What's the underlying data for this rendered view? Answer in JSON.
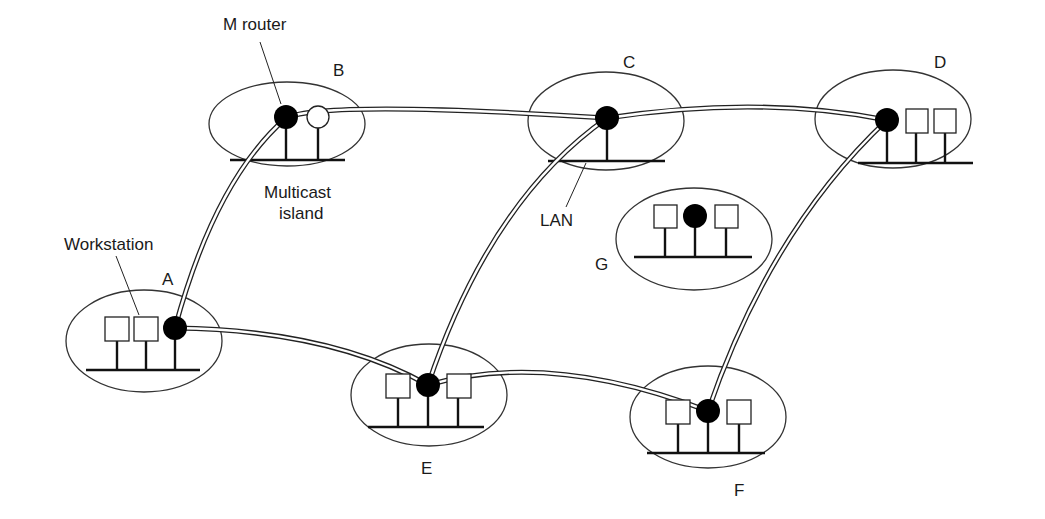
{
  "figure": {
    "islands": [
      {
        "id": "A",
        "label": "A",
        "workstations": 2,
        "router": "multicast"
      },
      {
        "id": "B",
        "label": "B",
        "workstations": 0,
        "router": "multicast",
        "extra_node": "non-multicast router"
      },
      {
        "id": "C",
        "label": "C",
        "workstations": 0,
        "router": "multicast"
      },
      {
        "id": "D",
        "label": "D",
        "workstations": 2,
        "router": "multicast"
      },
      {
        "id": "E",
        "label": "E",
        "workstations": 2,
        "router": "multicast"
      },
      {
        "id": "F",
        "label": "F",
        "workstations": 2,
        "router": "multicast"
      },
      {
        "id": "G",
        "label": "G",
        "workstations": 2,
        "router": "multicast",
        "connected": false
      }
    ],
    "tunnels": [
      [
        "A",
        "B"
      ],
      [
        "B",
        "C"
      ],
      [
        "C",
        "D"
      ],
      [
        "A",
        "E"
      ],
      [
        "E",
        "F"
      ],
      [
        "C",
        "E"
      ],
      [
        "D",
        "F"
      ]
    ],
    "annotations": {
      "m_router": "M router",
      "multicast_island_1": "Multicast",
      "multicast_island_2": "island",
      "workstation": "Workstation",
      "lan": "LAN"
    },
    "colors": {
      "line": "#111111",
      "background": "#ffffff",
      "router": "#000000"
    }
  }
}
